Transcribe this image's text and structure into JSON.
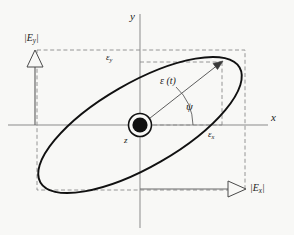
{
  "figure": {
    "kind": "polarization-ellipse-diagram",
    "background_color": "#f8f8f6",
    "stroke_color": "#1a1a1a",
    "axis_color": "#7a7a7a",
    "dash_color": "#8a8a8a",
    "ellipse_color": "#111111"
  },
  "axes": {
    "x_label": "x",
    "y_label": "y",
    "z_label": "z",
    "origin": {
      "x": 140,
      "y": 125
    },
    "x_axis": {
      "x1": 8,
      "y1": 125,
      "x2": 268,
      "y2": 125
    },
    "y_axis": {
      "x1": 140,
      "y1": 14,
      "x2": 140,
      "y2": 228
    }
  },
  "ellipse": {
    "center_x": 140,
    "center_y": 125,
    "semi_major": 115,
    "semi_minor": 42,
    "tilt_degrees": -30,
    "stroke_width": 1.9
  },
  "bounding_box": {
    "left": 37,
    "top": 50,
    "right": 245,
    "bottom": 190
  },
  "vector": {
    "label": "ε (t)",
    "label_epsilon": "ε",
    "label_arg": "(t)",
    "tip_x": 222,
    "tip_y": 62,
    "angle_label": "ψ",
    "angle_name": "psi"
  },
  "components": {
    "eps_x_label": "ε",
    "eps_x_sub": "x",
    "eps_y_label": "ε",
    "eps_y_sub": "y"
  },
  "magnitudes": {
    "ey_label": "|E",
    "ey_sub": "y",
    "ey_close": "|",
    "ey_full": "|Ey|",
    "ex_label": "|E",
    "ex_sub": "x",
    "ex_close": "|",
    "ex_full": "|Ex|"
  },
  "arrows": {
    "vertical": {
      "x": 35,
      "tail_y": 125,
      "head_y": 51
    },
    "horizontal": {
      "y": 189,
      "tail_x": 140,
      "head_x": 246
    }
  },
  "icons": {
    "z_out_of_page": "z-axis-out-of-page-icon",
    "arrowhead_open": "open-triangle-arrowhead-icon",
    "arrowhead_solid": "solid-arrowhead-icon"
  }
}
